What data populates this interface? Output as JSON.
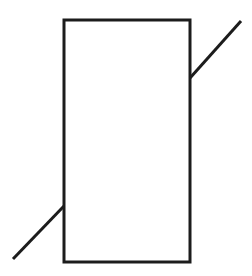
{
  "canvas": {
    "width": 252,
    "height": 276,
    "background_color": "#ffffff",
    "description": "Line drawing of a tall upright rectangle crossed by two short diagonal line segments at opposite corners"
  },
  "style": {
    "stroke_color": "#1c1c1c",
    "stroke_width": 3,
    "fill": "none"
  },
  "figure": {
    "shapes": [
      {
        "id": "main-rectangle",
        "type": "rect",
        "x": 64,
        "y": 20,
        "width": 126,
        "height": 242,
        "stroke_color": "#1c1c1c",
        "stroke_width": 3,
        "fill": "none"
      },
      {
        "id": "upper-right-diagonal",
        "type": "line",
        "x1": 190,
        "y1": 78,
        "x2": 241,
        "y2": 21,
        "stroke_color": "#1c1c1c",
        "stroke_width": 3
      },
      {
        "id": "lower-left-diagonal",
        "type": "line",
        "x1": 64,
        "y1": 206,
        "x2": 13,
        "y2": 259,
        "stroke_color": "#1c1c1c",
        "stroke_width": 3
      }
    ]
  }
}
